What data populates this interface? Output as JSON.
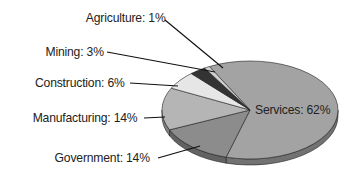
{
  "chart_data": {
    "type": "pie",
    "title": "",
    "style": "3d",
    "categories": [
      "Services",
      "Government",
      "Manufacturing",
      "Construction",
      "Mining",
      "Agriculture"
    ],
    "values": [
      62,
      14,
      14,
      6,
      3,
      1
    ],
    "labels": [
      "Services: 62%",
      "Government: 14%",
      "Manufacturing: 14%",
      "Construction: 6%",
      "Mining: 3%",
      "Agriculture: 1%"
    ],
    "colors": [
      "#a3a3a3",
      "#8c8c8c",
      "#b5b5b5",
      "#e6e6e6",
      "#333333",
      "#cfcfcf"
    ],
    "legend": "none"
  }
}
